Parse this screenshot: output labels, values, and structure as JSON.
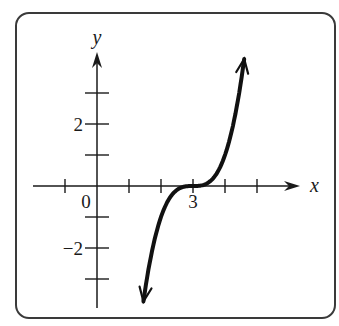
{
  "chart_data": {
    "type": "line",
    "title": "",
    "xlabel": "x",
    "ylabel": "y",
    "function": "y = (x - 3)^3",
    "xlim": [
      -2,
      6
    ],
    "ylim": [
      -4,
      4
    ],
    "grid": false,
    "legend": null,
    "x_ticks": [
      -1,
      0,
      1,
      2,
      3,
      4,
      5
    ],
    "y_ticks": [
      -3,
      -2,
      -1,
      1,
      2,
      3
    ],
    "x_tick_labels": [
      {
        "value": 0,
        "label": "0"
      },
      {
        "value": 3,
        "label": "3"
      }
    ],
    "y_tick_labels": [
      {
        "value": 2,
        "label": "2"
      },
      {
        "value": -2,
        "label": "−2"
      }
    ],
    "series": [
      {
        "name": "f(x)",
        "x": [
          1.45,
          1.8,
          2.2,
          2.6,
          3.0,
          3.4,
          3.8,
          4.2,
          4.6
        ],
        "y": [
          -3.72,
          -1.73,
          -0.51,
          -0.06,
          0.0,
          0.06,
          0.51,
          1.73,
          4.1
        ],
        "arrows_at_ends": true
      }
    ],
    "annotations": [
      "Curve has horizontal inflection point at (3, 0)"
    ]
  },
  "layout": {
    "origin_px": [
      97,
      186
    ],
    "unit_x_px": 32,
    "unit_y_px": 31,
    "x_axis_px": [
      33,
      300
    ],
    "y_axis_px": [
      52,
      308
    ],
    "frame": {
      "x": 16,
      "y": 13,
      "w": 319,
      "h": 305,
      "r": 13
    }
  },
  "colors": {
    "axis": "#1a1a1a",
    "curve": "#111111",
    "frame": "#3a3a3a",
    "background": "#ffffff"
  }
}
